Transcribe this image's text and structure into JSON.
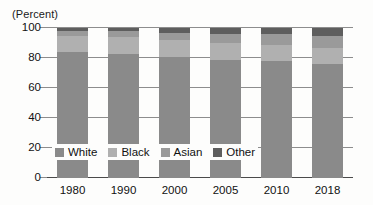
{
  "chart_data": {
    "type": "bar",
    "subtype": "stacked-bar-100-percent",
    "title": "",
    "unit_label": "(Percent)",
    "xlabel": "",
    "ylabel": "",
    "ylim": [
      0,
      100
    ],
    "ytick_values": [
      0,
      20,
      40,
      60,
      80,
      100
    ],
    "ytick_labels": [
      "0",
      "20",
      "40",
      "60",
      "80",
      "100"
    ],
    "grid": true,
    "legend_position": "inside-bottom-left",
    "categories": [
      "1980",
      "1990",
      "2000",
      "2005",
      "2010",
      "2018"
    ],
    "series": [
      {
        "name": "White",
        "color": "#8a8a8a",
        "values": [
          84,
          83,
          81,
          79,
          78,
          76
        ]
      },
      {
        "name": "Black",
        "color": "#b0b0b0",
        "values": [
          11,
          11,
          11,
          11,
          11,
          11
        ]
      },
      {
        "name": "Asian",
        "color": "#9a9a9a",
        "values": [
          3,
          4,
          5,
          6,
          7,
          8
        ]
      },
      {
        "name": "Other",
        "color": "#5e5e5e",
        "values": [
          2,
          2,
          3,
          4,
          4,
          5
        ]
      }
    ]
  },
  "legend": {
    "items": [
      {
        "label": "White"
      },
      {
        "label": "Black"
      },
      {
        "label": "Asian"
      },
      {
        "label": "Other"
      }
    ]
  },
  "colors": {
    "white_series": "#8a8a8a",
    "black_series": "#b0b0b0",
    "asian_series": "#9a9a9a",
    "other_series": "#5e5e5e",
    "gridline": "#8d8d8d",
    "axis": "#4a4a4a",
    "text": "#111111",
    "background": "#fdfdfc"
  }
}
